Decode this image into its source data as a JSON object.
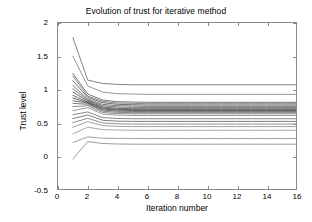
{
  "chart_data": {
    "type": "line",
    "title": "Evolution of trust for iterative method",
    "xlabel": "Iteration number",
    "ylabel": "Trust level",
    "xlim": [
      0,
      16
    ],
    "ylim": [
      -0.5,
      2
    ],
    "xticks": [
      0,
      2,
      4,
      6,
      8,
      10,
      12,
      14,
      16
    ],
    "yticks": [
      -0.5,
      0,
      0.5,
      1,
      1.5,
      2
    ],
    "xtick_labels": [
      "0",
      "2",
      "4",
      "6",
      "8",
      "10",
      "12",
      "14",
      "16"
    ],
    "ytick_labels": [
      "-0.5",
      "0",
      "0.5",
      "1",
      "1.5",
      "2"
    ],
    "grid": false,
    "legend": null,
    "x": [
      1,
      2,
      3,
      4,
      5,
      6,
      7,
      8,
      9,
      10,
      11,
      12,
      13,
      14,
      15,
      16
    ],
    "series": [
      {
        "name": "agent-1",
        "color": "#4d4d4d",
        "values": [
          1.78,
          1.14,
          1.09,
          1.075,
          1.07,
          1.07,
          1.07,
          1.07,
          1.07,
          1.07,
          1.07,
          1.07,
          1.07,
          1.07,
          1.07,
          1.07
        ]
      },
      {
        "name": "agent-2",
        "color": "#6b6b6b",
        "values": [
          1.5,
          1.05,
          0.96,
          0.935,
          0.93,
          0.925,
          0.925,
          0.925,
          0.925,
          0.925,
          0.925,
          0.925,
          0.925,
          0.925,
          0.925,
          0.925
        ]
      },
      {
        "name": "agent-3",
        "color": "#3d3d3d",
        "values": [
          1.24,
          0.93,
          0.84,
          0.815,
          0.81,
          0.805,
          0.805,
          0.805,
          0.805,
          0.805,
          0.805,
          0.805,
          0.805,
          0.805,
          0.805,
          0.805
        ]
      },
      {
        "name": "agent-4",
        "color": "#555555",
        "values": [
          1.2,
          0.9,
          0.82,
          0.795,
          0.79,
          0.785,
          0.785,
          0.785,
          0.785,
          0.785,
          0.785,
          0.785,
          0.785,
          0.785,
          0.785,
          0.785
        ]
      },
      {
        "name": "agent-5",
        "color": "#2e2e2e",
        "values": [
          1.13,
          0.88,
          0.8,
          0.775,
          0.77,
          0.765,
          0.765,
          0.765,
          0.765,
          0.765,
          0.765,
          0.765,
          0.765,
          0.765,
          0.765,
          0.765
        ]
      },
      {
        "name": "agent-6",
        "color": "#464646",
        "values": [
          1.06,
          0.855,
          0.775,
          0.755,
          0.75,
          0.745,
          0.745,
          0.745,
          0.745,
          0.745,
          0.745,
          0.745,
          0.745,
          0.745,
          0.745,
          0.745
        ]
      },
      {
        "name": "agent-7",
        "color": "#383838",
        "values": [
          1.01,
          0.84,
          0.755,
          0.735,
          0.73,
          0.73,
          0.73,
          0.73,
          0.73,
          0.73,
          0.73,
          0.73,
          0.73,
          0.73,
          0.73,
          0.73
        ]
      },
      {
        "name": "agent-8",
        "color": "#2a2a2a",
        "values": [
          0.96,
          0.825,
          0.735,
          0.715,
          0.71,
          0.71,
          0.71,
          0.71,
          0.71,
          0.71,
          0.71,
          0.71,
          0.71,
          0.71,
          0.71,
          0.71
        ]
      },
      {
        "name": "agent-9",
        "color": "#333333",
        "values": [
          0.91,
          0.81,
          0.72,
          0.7,
          0.695,
          0.695,
          0.695,
          0.695,
          0.695,
          0.695,
          0.695,
          0.695,
          0.695,
          0.695,
          0.695,
          0.695
        ]
      },
      {
        "name": "agent-10",
        "color": "#1f1f1f",
        "values": [
          0.87,
          0.8,
          0.705,
          0.688,
          0.683,
          0.683,
          0.683,
          0.683,
          0.683,
          0.683,
          0.683,
          0.683,
          0.683,
          0.683,
          0.683,
          0.683
        ]
      },
      {
        "name": "agent-11",
        "color": "#3a3a3a",
        "values": [
          0.83,
          0.79,
          0.69,
          0.672,
          0.668,
          0.668,
          0.668,
          0.668,
          0.668,
          0.668,
          0.668,
          0.668,
          0.668,
          0.668,
          0.668,
          0.668
        ]
      },
      {
        "name": "agent-12",
        "color": "#4a4a4a",
        "values": [
          0.79,
          0.775,
          0.672,
          0.655,
          0.65,
          0.65,
          0.65,
          0.65,
          0.65,
          0.65,
          0.65,
          0.65,
          0.65,
          0.65,
          0.65,
          0.65
        ]
      },
      {
        "name": "agent-13",
        "color": "#5c5c5c",
        "values": [
          0.74,
          0.755,
          0.652,
          0.636,
          0.632,
          0.632,
          0.632,
          0.632,
          0.632,
          0.632,
          0.632,
          0.632,
          0.632,
          0.632,
          0.632,
          0.632
        ]
      },
      {
        "name": "agent-14",
        "color": "#6e6e6e",
        "values": [
          0.68,
          0.725,
          0.628,
          0.612,
          0.608,
          0.608,
          0.608,
          0.608,
          0.608,
          0.608,
          0.608,
          0.608,
          0.608,
          0.608,
          0.608,
          0.608
        ]
      },
      {
        "name": "agent-15",
        "color": "#565656",
        "values": [
          0.62,
          0.66,
          0.575,
          0.562,
          0.558,
          0.558,
          0.558,
          0.558,
          0.558,
          0.558,
          0.558,
          0.558,
          0.558,
          0.558,
          0.558,
          0.558
        ]
      },
      {
        "name": "agent-16",
        "color": "#444444",
        "values": [
          0.56,
          0.615,
          0.535,
          0.522,
          0.518,
          0.518,
          0.518,
          0.518,
          0.518,
          0.518,
          0.518,
          0.518,
          0.518,
          0.518,
          0.518,
          0.518
        ]
      },
      {
        "name": "agent-17",
        "color": "#606060",
        "values": [
          0.5,
          0.565,
          0.495,
          0.482,
          0.478,
          0.478,
          0.478,
          0.478,
          0.478,
          0.478,
          0.478,
          0.478,
          0.478,
          0.478,
          0.478,
          0.478
        ]
      },
      {
        "name": "agent-18",
        "color": "#767676",
        "values": [
          0.43,
          0.515,
          0.455,
          0.444,
          0.44,
          0.44,
          0.44,
          0.44,
          0.44,
          0.44,
          0.44,
          0.44,
          0.44,
          0.44,
          0.44,
          0.44
        ]
      },
      {
        "name": "agent-19",
        "color": "#828282",
        "values": [
          0.33,
          0.43,
          0.395,
          0.388,
          0.385,
          0.385,
          0.385,
          0.385,
          0.385,
          0.385,
          0.385,
          0.385,
          0.385,
          0.385,
          0.385,
          0.385
        ]
      },
      {
        "name": "agent-20",
        "color": "#7a7a7a",
        "values": [
          0.2,
          0.285,
          0.265,
          0.262,
          0.26,
          0.26,
          0.26,
          0.26,
          0.26,
          0.26,
          0.26,
          0.26,
          0.26,
          0.26,
          0.26,
          0.26
        ]
      },
      {
        "name": "agent-21",
        "color": "#707070",
        "values": [
          -0.05,
          0.215,
          0.185,
          0.178,
          0.175,
          0.175,
          0.175,
          0.175,
          0.175,
          0.175,
          0.175,
          0.175,
          0.175,
          0.175,
          0.175,
          0.175
        ]
      }
    ]
  },
  "axes": {
    "frame_color": "#8a8a8a",
    "tick_color": "#8a8a8a",
    "text_color": "#000000",
    "background": "#ffffff"
  }
}
